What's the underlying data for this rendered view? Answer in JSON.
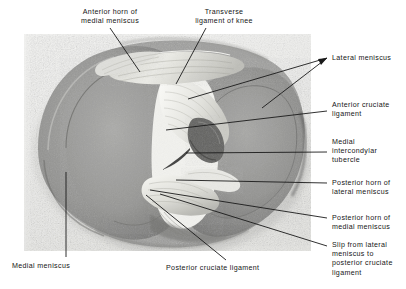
{
  "figure": {
    "kind": "anatomical-photograph-with-leader-labels",
    "background_color": "#ffffff",
    "photo_tint": "#e8e8e6",
    "ink_color": "#1a1a1a"
  },
  "labels": {
    "anterior_horn_medial_meniscus": "Anterior horn of\nmedial meniscus",
    "transverse_ligament_of_knee": "Transverse\nligament of knee",
    "lateral_meniscus": "Lateral meniscus",
    "anterior_cruciate_ligament": "Anterior cruciate\nligament",
    "medial_intercondylar_tubercle": "Medial\nintercondylar\ntubercle",
    "posterior_horn_lateral_meniscus": "Posterior horn of\nlateral meniscus",
    "posterior_horn_medial_meniscus": "Posterior horn of\nmedial meniscus",
    "slip_from_lateral_meniscus": "Slip from lateral\nmeniscus to\nposterior cruciate\nligament",
    "medial_meniscus": "Medial meniscus",
    "posterior_cruciate_ligament": "Posterior cruciate ligament"
  },
  "structures": [
    {
      "name": "medial-meniscus",
      "tone": "#8d8d8c"
    },
    {
      "name": "lateral-meniscus",
      "tone": "#8a8a89"
    },
    {
      "name": "medial-condyle-surface",
      "tone": "#9a9a98"
    },
    {
      "name": "lateral-condyle-surface",
      "tone": "#979795"
    },
    {
      "name": "anterior-cruciate-ligament",
      "tone": "#efefec"
    },
    {
      "name": "posterior-cruciate-ligament",
      "tone": "#e4e4e0"
    },
    {
      "name": "transverse-ligament",
      "tone": "#d8d8d4"
    },
    {
      "name": "intercondylar-eminence",
      "tone": "#555553"
    }
  ]
}
